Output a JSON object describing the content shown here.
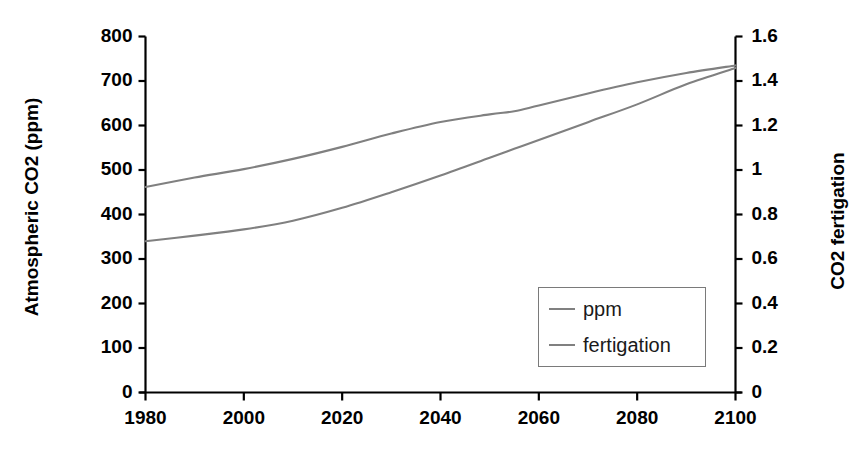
{
  "chart_data": {
    "type": "line",
    "title": "",
    "xlabel": "",
    "ylabel": "Atmospheric CO2 (ppm)",
    "y2label": "CO2 fertigation",
    "xlim": [
      1980,
      2100
    ],
    "ylim": [
      0,
      800
    ],
    "y2lim": [
      0,
      1.6
    ],
    "grid": false,
    "legend_position": "lower-right",
    "xticks": [
      "1980",
      "2000",
      "2020",
      "2040",
      "2060",
      "2080",
      "2100"
    ],
    "xtick_values": [
      1980,
      2000,
      2020,
      2040,
      2060,
      2080,
      2100
    ],
    "yticks": [
      "0",
      "100",
      "200",
      "300",
      "400",
      "500",
      "600",
      "700",
      "800"
    ],
    "ytick_values": [
      0,
      100,
      200,
      300,
      400,
      500,
      600,
      700,
      800
    ],
    "y2ticks": [
      "0",
      "0.2",
      "0.4",
      "0.6",
      "0.8",
      "1",
      "1.2",
      "1.4",
      "1.6"
    ],
    "y2tick_values": [
      0,
      0.2,
      0.4,
      0.6,
      0.8,
      1.0,
      1.2,
      1.4,
      1.6
    ],
    "x": [
      1980,
      1990,
      2000,
      2010,
      2020,
      2030,
      2040,
      2050,
      2055,
      2060,
      2070,
      2080,
      2090,
      2100
    ],
    "series": [
      {
        "name": "ppm",
        "axis": "left",
        "color": "#808080",
        "values": [
          462,
          483,
          502,
          525,
          552,
          582,
          608,
          625,
          632,
          645,
          672,
          697,
          718,
          735
        ]
      },
      {
        "name": "fertigation",
        "axis": "right",
        "color": "#808080",
        "values": [
          0.68,
          0.705,
          0.733,
          0.772,
          0.83,
          0.9,
          0.975,
          1.055,
          1.095,
          1.135,
          1.215,
          1.295,
          1.385,
          1.458
        ]
      }
    ],
    "legend": [
      "ppm",
      "fertigation"
    ]
  },
  "legend": {
    "items": [
      {
        "label": "ppm"
      },
      {
        "label": "fertigation"
      }
    ]
  },
  "colors": {
    "line": "#808080",
    "axis": "#000000",
    "legend_border": "#7a7a7a",
    "background": "#ffffff"
  }
}
